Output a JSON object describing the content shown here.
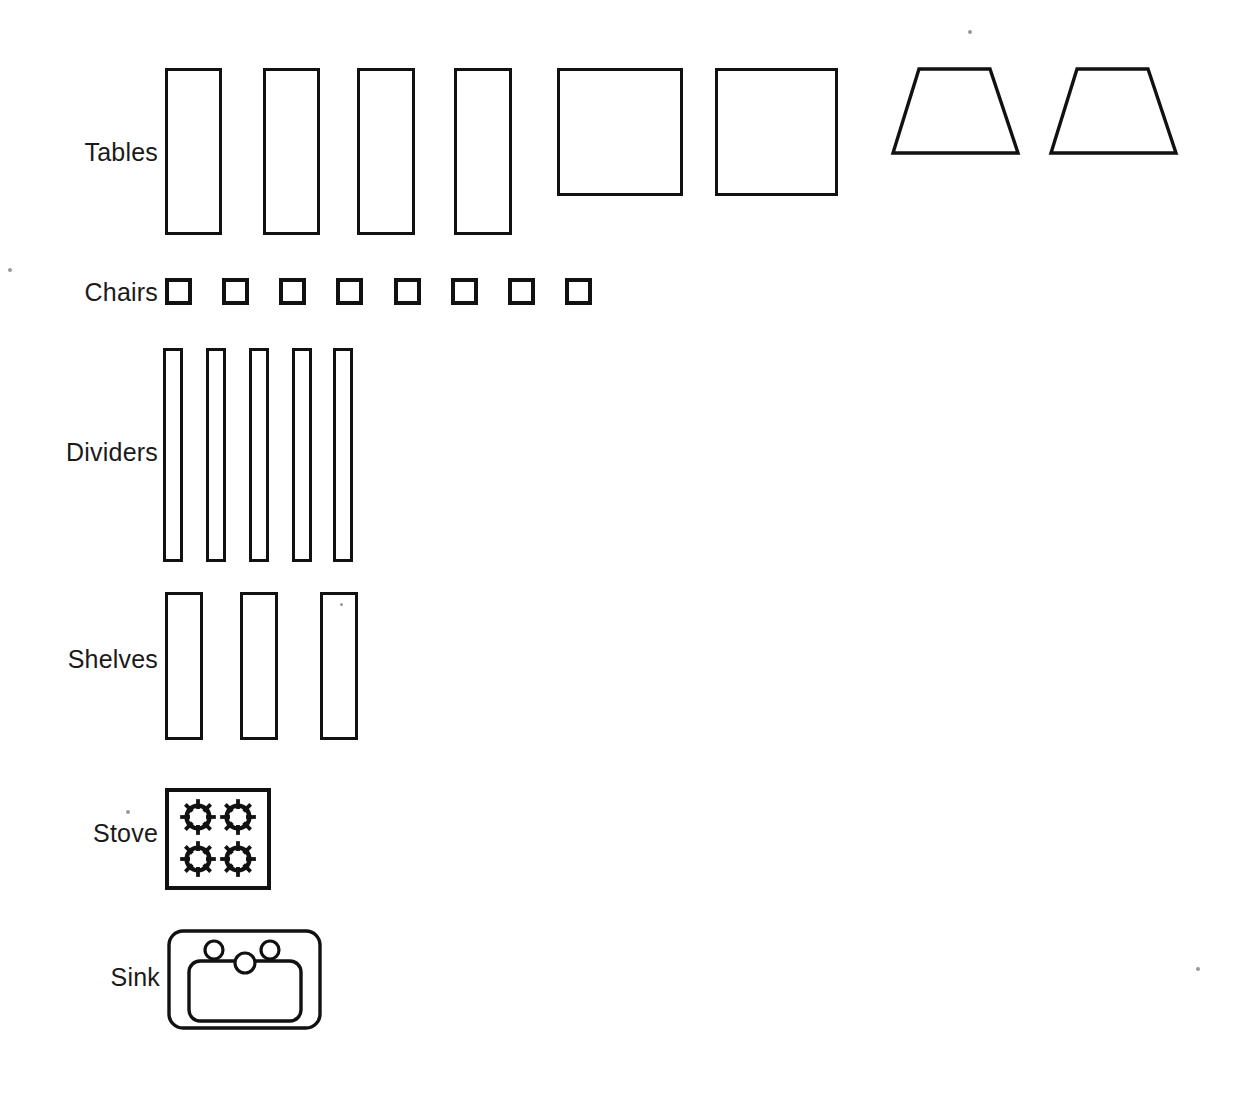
{
  "sheet": {
    "width": 1238,
    "height": 1095,
    "background": "#ffffff",
    "ink": "#111111",
    "title": "Furniture and fixture symbol legend"
  },
  "rows": [
    {
      "key": "tables",
      "label": "Tables",
      "label_x": 158,
      "label_y": 152,
      "count": 8
    },
    {
      "key": "chairs",
      "label": "Chairs",
      "label_x": 158,
      "label_y": 292,
      "count": 8
    },
    {
      "key": "dividers",
      "label": "Dividers",
      "label_x": 158,
      "label_y": 452,
      "count": 5
    },
    {
      "key": "shelves",
      "label": "Shelves",
      "label_x": 158,
      "label_y": 659,
      "count": 3
    },
    {
      "key": "stove",
      "label": "Stove",
      "label_x": 158,
      "label_y": 833,
      "count": 1
    },
    {
      "key": "sink",
      "label": "Sink",
      "label_x": 160,
      "label_y": 977,
      "count": 1
    }
  ],
  "tables": {
    "rectangles": [
      {
        "name": "table-rect-1",
        "x": 165,
        "y": 68,
        "w": 57,
        "h": 167
      },
      {
        "name": "table-rect-2",
        "x": 263,
        "y": 68,
        "w": 57,
        "h": 167
      },
      {
        "name": "table-rect-3",
        "x": 357,
        "y": 68,
        "w": 58,
        "h": 167
      },
      {
        "name": "table-rect-4",
        "x": 454,
        "y": 68,
        "w": 58,
        "h": 167
      },
      {
        "name": "table-square-5",
        "x": 557,
        "y": 68,
        "w": 126,
        "h": 128
      },
      {
        "name": "table-square-6",
        "x": 715,
        "y": 68,
        "w": 123,
        "h": 128
      }
    ],
    "trapezoids": [
      {
        "name": "table-trapezoid-7",
        "x": 890,
        "y": 66,
        "w": 132,
        "h": 90,
        "top_left": 29,
        "top_right": 100,
        "bottom_left": 3,
        "bottom_right": 128
      },
      {
        "name": "table-trapezoid-8",
        "x": 1048,
        "y": 66,
        "w": 132,
        "h": 90,
        "top_left": 29,
        "top_right": 100,
        "bottom_left": 3,
        "bottom_right": 128
      }
    ]
  },
  "chairs": {
    "y": 278,
    "size": 27,
    "pitch": 57,
    "start_x": 165,
    "squares": [
      {
        "name": "chair-1",
        "x": 165
      },
      {
        "name": "chair-2",
        "x": 222
      },
      {
        "name": "chair-3",
        "x": 279
      },
      {
        "name": "chair-4",
        "x": 336
      },
      {
        "name": "chair-5",
        "x": 394
      },
      {
        "name": "chair-6",
        "x": 451
      },
      {
        "name": "chair-7",
        "x": 508
      },
      {
        "name": "chair-8",
        "x": 565
      }
    ]
  },
  "dividers": {
    "y": 348,
    "h": 214,
    "w": 20,
    "bars": [
      {
        "name": "divider-1",
        "x": 163
      },
      {
        "name": "divider-2",
        "x": 206
      },
      {
        "name": "divider-3",
        "x": 249
      },
      {
        "name": "divider-4",
        "x": 292
      },
      {
        "name": "divider-5",
        "x": 333
      }
    ]
  },
  "shelves": {
    "y": 592,
    "h": 148,
    "w": 38,
    "bars": [
      {
        "name": "shelf-1",
        "x": 165
      },
      {
        "name": "shelf-2",
        "x": 240
      },
      {
        "name": "shelf-3",
        "x": 320
      }
    ]
  },
  "stove": {
    "x": 165,
    "y": 788,
    "w": 106,
    "h": 102,
    "burner_size": 38,
    "burner_spokes": 8,
    "burners": [
      {
        "name": "stove-burner-top-left",
        "x": 14,
        "y": 10
      },
      {
        "name": "stove-burner-top-right",
        "x": 54,
        "y": 10
      },
      {
        "name": "stove-burner-bottom-left",
        "x": 14,
        "y": 52
      },
      {
        "name": "stove-burner-bottom-right",
        "x": 54,
        "y": 52
      }
    ]
  },
  "sink": {
    "x": 167,
    "y": 929,
    "w": 155,
    "h": 101,
    "outer_radius": 14,
    "basin": {
      "x": 22,
      "y": 32,
      "w": 112,
      "h": 60,
      "radius": 11
    },
    "taps": [
      {
        "name": "sink-tap-left",
        "cx": 47,
        "cy": 21,
        "r": 9
      },
      {
        "name": "sink-tap-right",
        "cx": 103,
        "cy": 21,
        "r": 9
      }
    ],
    "drain": {
      "name": "sink-drain",
      "cx": 78,
      "cy": 34,
      "r": 10
    }
  },
  "specks": [
    {
      "name": "speck-top-right",
      "x": 968,
      "y": 30,
      "size": 4
    },
    {
      "name": "speck-left-margin",
      "x": 8,
      "y": 268,
      "size": 4
    },
    {
      "name": "speck-shelf",
      "x": 340,
      "y": 603,
      "size": 3
    },
    {
      "name": "speck-stove-label",
      "x": 126,
      "y": 810,
      "size": 4
    },
    {
      "name": "speck-bottom-right",
      "x": 1196,
      "y": 967,
      "size": 4
    }
  ]
}
